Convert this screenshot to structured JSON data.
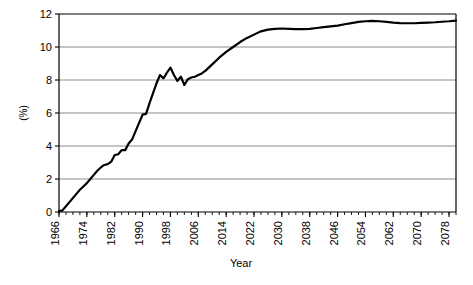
{
  "chart_data": {
    "type": "line",
    "title": "",
    "subtitle": "",
    "xlabel": "Year",
    "ylabel": "(%)",
    "xlim": [
      1966,
      2080
    ],
    "ylim": [
      0,
      12
    ],
    "ytick_labels": [
      "0",
      "2",
      "4",
      "6",
      "8",
      "10",
      "12"
    ],
    "yticks": [
      0,
      2,
      4,
      6,
      8,
      10,
      12
    ],
    "xtick_labels": [
      "1966",
      "1974",
      "1982",
      "1990",
      "1998",
      "2006",
      "2014",
      "2022",
      "2030",
      "2038",
      "2046",
      "2054",
      "2062",
      "2070",
      "2078"
    ],
    "xticks": [
      1966,
      1974,
      1982,
      1990,
      1998,
      2006,
      2014,
      2022,
      2030,
      2038,
      2046,
      2054,
      2062,
      2070,
      2078
    ],
    "x_minor_tick_step": 2,
    "grid": "horizontal",
    "grid_color": "#808080",
    "legend": "none",
    "line_color": "#000000",
    "line_width": 2.2,
    "axis_color": "#000000",
    "background_color": "#ffffff",
    "series": [
      {
        "name": "percentage",
        "x": [
          1966,
          1967,
          1968,
          1969,
          1970,
          1971,
          1972,
          1973,
          1974,
          1975,
          1976,
          1977,
          1978,
          1979,
          1980,
          1981,
          1982,
          1983,
          1984,
          1985,
          1986,
          1987,
          1988,
          1989,
          1990,
          1991,
          1992,
          1993,
          1994,
          1995,
          1996,
          1997,
          1998,
          1999,
          2000,
          2001,
          2002,
          2003,
          2004,
          2005,
          2006,
          2007,
          2008,
          2010,
          2012,
          2014,
          2016,
          2018,
          2020,
          2022,
          2024,
          2026,
          2028,
          2030,
          2032,
          2034,
          2036,
          2038,
          2040,
          2042,
          2044,
          2046,
          2048,
          2050,
          2052,
          2054,
          2056,
          2058,
          2060,
          2062,
          2064,
          2066,
          2068,
          2070,
          2072,
          2074,
          2076,
          2078,
          2080
        ],
        "y": [
          0.05,
          0.1,
          0.35,
          0.6,
          0.85,
          1.1,
          1.35,
          1.55,
          1.75,
          2.0,
          2.25,
          2.5,
          2.7,
          2.85,
          2.9,
          3.05,
          3.45,
          3.5,
          3.75,
          3.75,
          4.15,
          4.4,
          4.9,
          5.4,
          5.9,
          5.95,
          6.6,
          7.2,
          7.8,
          8.3,
          8.1,
          8.45,
          8.75,
          8.3,
          7.95,
          8.2,
          7.7,
          8.05,
          8.15,
          8.2,
          8.3,
          8.4,
          8.55,
          8.95,
          9.35,
          9.7,
          10.0,
          10.3,
          10.55,
          10.75,
          10.95,
          11.05,
          11.1,
          11.12,
          11.1,
          11.08,
          11.08,
          11.1,
          11.15,
          11.2,
          11.25,
          11.3,
          11.38,
          11.45,
          11.52,
          11.56,
          11.58,
          11.56,
          11.52,
          11.48,
          11.45,
          11.44,
          11.44,
          11.46,
          11.48,
          11.5,
          11.53,
          11.56,
          11.6
        ]
      }
    ]
  },
  "axis": {
    "y_title": "(%)",
    "x_title": "Year"
  }
}
